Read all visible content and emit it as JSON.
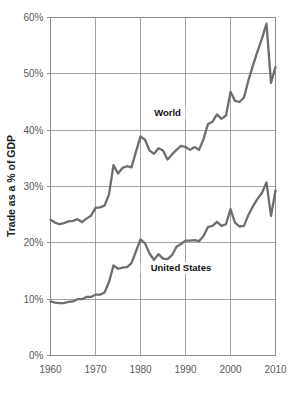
{
  "chart_data": {
    "type": "line",
    "title": "",
    "xlabel": "",
    "ylabel": "Trade as a % of GDP",
    "xlim": [
      1960,
      2010
    ],
    "ylim": [
      0,
      60
    ],
    "grid": true,
    "legend_position": "inline-labels",
    "x_ticks": [
      "1960",
      "1970",
      "1980",
      "1990",
      "2000",
      "2010"
    ],
    "x_tick_values": [
      1960,
      1970,
      1980,
      1990,
      2000,
      2010
    ],
    "y_ticks": [
      "0%",
      "10%",
      "20%",
      "30%",
      "40%",
      "50%",
      "60%"
    ],
    "y_tick_values": [
      0,
      10,
      20,
      30,
      40,
      50,
      60
    ],
    "x": [
      1960,
      1961,
      1962,
      1963,
      1964,
      1965,
      1966,
      1967,
      1968,
      1969,
      1970,
      1971,
      1972,
      1973,
      1974,
      1975,
      1976,
      1977,
      1978,
      1979,
      1980,
      1981,
      1982,
      1983,
      1984,
      1985,
      1986,
      1987,
      1988,
      1989,
      1990,
      1991,
      1992,
      1993,
      1994,
      1995,
      1996,
      1997,
      1998,
      1999,
      2000,
      2001,
      2002,
      2003,
      2004,
      2005,
      2006,
      2007,
      2008,
      2009,
      2010
    ],
    "series": [
      {
        "name": "World",
        "label": "World",
        "color": "#6e6e6e",
        "label_x": 1986,
        "label_y": 42.5,
        "values": [
          24.1,
          23.6,
          23.3,
          23.5,
          23.8,
          23.9,
          24.2,
          23.7,
          24.3,
          24.8,
          26.2,
          26.3,
          26.6,
          28.6,
          33.8,
          32.3,
          33.3,
          33.6,
          33.4,
          36.2,
          38.9,
          38.3,
          36.4,
          35.8,
          36.8,
          36.4,
          34.8,
          35.7,
          36.5,
          37.2,
          37.0,
          36.5,
          37.0,
          36.5,
          38.4,
          41.1,
          41.5,
          42.8,
          42.0,
          42.6,
          46.8,
          45.2,
          45.0,
          45.8,
          48.9,
          51.5,
          54.0,
          56.3,
          58.9,
          48.4,
          51.2
        ]
      },
      {
        "name": "United States",
        "label": "United States",
        "color": "#6e6e6e",
        "label_x": 1989,
        "label_y": 15.0,
        "values": [
          9.6,
          9.4,
          9.3,
          9.3,
          9.5,
          9.6,
          10.0,
          10.0,
          10.4,
          10.4,
          10.8,
          10.8,
          11.2,
          13.0,
          16.0,
          15.4,
          15.6,
          15.7,
          16.4,
          18.5,
          20.6,
          19.9,
          18.1,
          17.0,
          18.0,
          17.2,
          17.1,
          17.8,
          19.3,
          19.8,
          20.4,
          20.4,
          20.5,
          20.3,
          21.2,
          22.8,
          23.0,
          23.7,
          23.0,
          23.3,
          26.0,
          23.6,
          22.9,
          23.0,
          25.0,
          26.5,
          27.8,
          28.9,
          30.7,
          24.8,
          29.3
        ]
      }
    ]
  }
}
